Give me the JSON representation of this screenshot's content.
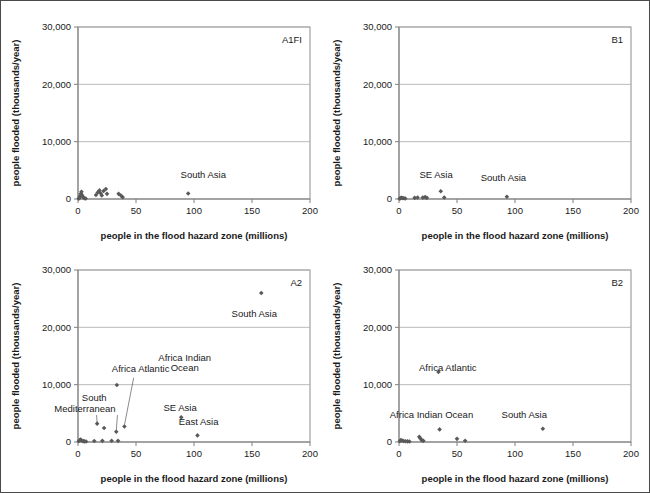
{
  "figure": {
    "panel_codes": [
      "A1FI",
      "B1",
      "A2",
      "B2"
    ]
  },
  "axes": {
    "xlabel": "people in the flood hazard zone (millions)",
    "ylabel": "people flooded (thousands/year)",
    "xticks": [
      "0",
      "50",
      "100",
      "150",
      "200"
    ],
    "yticks": [
      "0",
      "10,000",
      "20,000",
      "30,000"
    ],
    "xlim": [
      0,
      200
    ],
    "ylim": [
      0,
      30000
    ],
    "xtick_values": [
      0,
      50,
      100,
      150,
      200
    ],
    "ytick_values": [
      0,
      10000,
      20000,
      30000
    ],
    "grid": "horizontal"
  },
  "chart_data": [
    {
      "type": "scatter",
      "title": "A1FI",
      "xlabel": "people in the flood hazard zone (millions)",
      "ylabel": "people flooded (thousands/year)",
      "xlim": [
        0,
        200
      ],
      "ylim": [
        0,
        30000
      ],
      "grid": "horizontal gridlines at 10,000 / 20,000 / 30,000",
      "points": [
        {
          "x": 0.6,
          "y": 60
        },
        {
          "x": 1.2,
          "y": 200
        },
        {
          "x": 1.8,
          "y": 520
        },
        {
          "x": 2.4,
          "y": 900
        },
        {
          "x": 3.0,
          "y": 1250
        },
        {
          "x": 3.6,
          "y": 640
        },
        {
          "x": 4.4,
          "y": 300
        },
        {
          "x": 5.4,
          "y": 120
        },
        {
          "x": 6.6,
          "y": 90
        },
        {
          "x": 15.5,
          "y": 700
        },
        {
          "x": 17.0,
          "y": 1150
        },
        {
          "x": 18.5,
          "y": 1500
        },
        {
          "x": 19.5,
          "y": 1000
        },
        {
          "x": 20.5,
          "y": 620
        },
        {
          "x": 22.0,
          "y": 1400
        },
        {
          "x": 24.0,
          "y": 1750
        },
        {
          "x": 25.0,
          "y": 900
        },
        {
          "x": 35.0,
          "y": 900
        },
        {
          "x": 37.0,
          "y": 600
        },
        {
          "x": 38.5,
          "y": 320
        },
        {
          "x": 95.0,
          "y": 950,
          "label": "South Asia"
        }
      ],
      "annotations": [
        {
          "text": "South Asia",
          "x": 108,
          "y": 3600
        }
      ]
    },
    {
      "type": "scatter",
      "title": "B1",
      "xlabel": "people in the flood hazard zone (millions)",
      "ylabel": "people flooded (thousands/year)",
      "xlim": [
        0,
        200
      ],
      "ylim": [
        0,
        30000
      ],
      "grid": "horizontal gridlines at 10,000 / 20,000 / 30,000",
      "points": [
        {
          "x": 0.5,
          "y": 60
        },
        {
          "x": 1.4,
          "y": 150
        },
        {
          "x": 2.2,
          "y": 220
        },
        {
          "x": 3.2,
          "y": 180
        },
        {
          "x": 4.2,
          "y": 120
        },
        {
          "x": 5.4,
          "y": 90
        },
        {
          "x": 13.5,
          "y": 200
        },
        {
          "x": 16.0,
          "y": 260
        },
        {
          "x": 20.5,
          "y": 240
        },
        {
          "x": 22.5,
          "y": 330
        },
        {
          "x": 24.0,
          "y": 200
        },
        {
          "x": 36.0,
          "y": 1350,
          "label": "SE Asia"
        },
        {
          "x": 39.0,
          "y": 260
        },
        {
          "x": 93.0,
          "y": 380,
          "label": "South Asia"
        }
      ],
      "annotations": [
        {
          "text": "SE Asia",
          "x": 32,
          "y": 3600
        },
        {
          "text": "South Asia",
          "x": 90,
          "y": 3200
        }
      ]
    },
    {
      "type": "scatter",
      "title": "A2",
      "xlabel": "people in the flood hazard zone (millions)",
      "ylabel": "people flooded (thousands/year)",
      "xlim": [
        0,
        200
      ],
      "ylim": [
        0,
        30000
      ],
      "grid": "horizontal gridlines at 10,000 / 20,000 / 30,000",
      "points": [
        {
          "x": 0.6,
          "y": 120
        },
        {
          "x": 1.4,
          "y": 300
        },
        {
          "x": 2.2,
          "y": 420
        },
        {
          "x": 3.2,
          "y": 250
        },
        {
          "x": 4.4,
          "y": 160
        },
        {
          "x": 5.6,
          "y": 110
        },
        {
          "x": 7.0,
          "y": 90
        },
        {
          "x": 14.0,
          "y": 180
        },
        {
          "x": 16.5,
          "y": 3200,
          "label": "South Mediterranean"
        },
        {
          "x": 21.0,
          "y": 200
        },
        {
          "x": 22.5,
          "y": 2450
        },
        {
          "x": 29.0,
          "y": 210
        },
        {
          "x": 33.0,
          "y": 1800
        },
        {
          "x": 33.5,
          "y": 9950,
          "label": "Africa Atlantic"
        },
        {
          "x": 34.5,
          "y": 200
        },
        {
          "x": 40.0,
          "y": 2700,
          "label": "Africa Indian Ocean"
        },
        {
          "x": 89.0,
          "y": 4300,
          "label": "SE Asia"
        },
        {
          "x": 103.0,
          "y": 1150,
          "label": "East Asia"
        },
        {
          "x": 158.0,
          "y": 26000,
          "label": "South Asia"
        }
      ],
      "annotations": [
        {
          "text": "South Asia",
          "x": 152,
          "y": 21800
        },
        {
          "text": "Africa Atlantic",
          "x": 54,
          "y": 12200
        },
        {
          "text": "Africa Indian",
          "x": 92,
          "y": 14200
        },
        {
          "text": "Ocean",
          "x": 92,
          "y": 12300
        },
        {
          "text": "South",
          "x": 14,
          "y": 7100
        },
        {
          "text": "Mediterranean",
          "x": 6,
          "y": 5300
        },
        {
          "text": "SE Asia",
          "x": 88,
          "y": 5400
        },
        {
          "text": "East Asia",
          "x": 104,
          "y": 2900
        }
      ]
    },
    {
      "type": "scatter",
      "title": "B2",
      "xlabel": "people in the flood hazard zone (millions)",
      "ylabel": "people flooded (thousands/year)",
      "xlim": [
        0,
        200
      ],
      "ylim": [
        0,
        30000
      ],
      "grid": "horizontal gridlines at 10,000 / 20,000 / 30,000",
      "points": [
        {
          "x": 0.6,
          "y": 120
        },
        {
          "x": 1.6,
          "y": 320
        },
        {
          "x": 2.6,
          "y": 260
        },
        {
          "x": 4.0,
          "y": 180
        },
        {
          "x": 5.6,
          "y": 140
        },
        {
          "x": 7.4,
          "y": 110
        },
        {
          "x": 9.0,
          "y": 90
        },
        {
          "x": 17.5,
          "y": 900
        },
        {
          "x": 18.5,
          "y": 600
        },
        {
          "x": 19.5,
          "y": 330
        },
        {
          "x": 21.0,
          "y": 200
        },
        {
          "x": 34.0,
          "y": 12200,
          "label": "Africa Atlantic"
        },
        {
          "x": 35.0,
          "y": 2200,
          "label": "Africa Indian Ocean"
        },
        {
          "x": 50.0,
          "y": 550
        },
        {
          "x": 57.0,
          "y": 230
        },
        {
          "x": 124.0,
          "y": 2300,
          "label": "South Asia"
        }
      ],
      "annotations": [
        {
          "text": "Africa Atlantic",
          "x": 42,
          "y": 12300
        },
        {
          "text": "Africa Indian Ocean",
          "x": 28,
          "y": 4200
        },
        {
          "text": "South Asia",
          "x": 108,
          "y": 4200
        }
      ]
    }
  ],
  "leader_lines": {
    "A2": [
      {
        "from_x": 48,
        "from_y": 11200,
        "to_x": 40,
        "to_y": 2900
      },
      {
        "from_x": 16,
        "from_y": 4700,
        "to_x": 16.5,
        "to_y": 3300
      },
      {
        "from_x": 34,
        "from_y": 4700,
        "to_x": 33,
        "to_y": 1900
      }
    ]
  },
  "colors": {
    "marker": "#595959",
    "gridline": "#b3b3b3",
    "axis": "#808080",
    "text": "#1a1a1a",
    "border": "#4a4a4a",
    "background": "#ffffff"
  }
}
